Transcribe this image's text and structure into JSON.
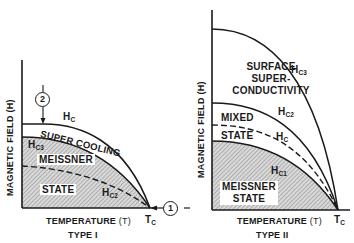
{
  "type1": {
    "title": "TYPE I",
    "x_axis": "TEMPERATURE",
    "x_axis_symbol": "(T)",
    "y_axis": "MAGNETIC FIELD (H)",
    "tc_label": "T",
    "tc_sub": "C",
    "curves": {
      "hc": {
        "label": "H",
        "sub": "C"
      },
      "hc3": {
        "label": "H",
        "sub": "C3"
      },
      "hc2": {
        "label": "H",
        "sub": "C2"
      }
    },
    "regions": {
      "supercooling": "SUPER COOLING",
      "meissner": "MEISSNER",
      "state": "STATE"
    },
    "markers": {
      "one": "1",
      "two": "2"
    }
  },
  "type2": {
    "title": "TYPE II",
    "x_axis": "TEMPERATURE",
    "x_axis_symbol": "(T)",
    "y_axis": "MAGNETIC FIELD (H)",
    "tc_label": "T",
    "tc_sub": "C",
    "curves": {
      "hc3": {
        "label": "H",
        "sub": "C3"
      },
      "hc2": {
        "label": "H",
        "sub": "C2"
      },
      "hc": {
        "label": "H",
        "sub": "C"
      },
      "hc1": {
        "label": "H",
        "sub": "C1"
      }
    },
    "regions": {
      "surface1": "SURFACE",
      "surface2": "SUPER-",
      "surface3": "CONDUCTIVITY",
      "mixed1": "MIXED",
      "mixed2": "STATE",
      "meissner1": "MEISSNER",
      "meissner2": "STATE"
    }
  },
  "colors": {
    "ink": "#1a1a1a",
    "hatch": "#8a8a8a",
    "background": "#ffffff"
  }
}
